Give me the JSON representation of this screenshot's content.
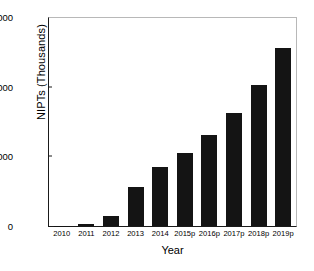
{
  "chart_data": {
    "type": "bar",
    "title": "",
    "xlabel": "Year",
    "ylabel": "NIPTs (Thousands)",
    "categories": [
      "2010",
      "2011",
      "2012",
      "2013",
      "2014",
      "2015p",
      "2016p",
      "2017p",
      "2018p",
      "2019p"
    ],
    "values": [
      5,
      25,
      150,
      560,
      840,
      1050,
      1300,
      1620,
      2030,
      2550
    ],
    "ylim": [
      0,
      3000
    ],
    "y_ticks": [
      0,
      1000,
      2000,
      3000
    ],
    "y_tick_labels": [
      "0",
      "1,000",
      "2,000",
      "3,000"
    ],
    "grid": false,
    "legend": "none",
    "bar_color": "#141414",
    "axis_color": "#1a1a1a",
    "frame_color": "#b8b8b8",
    "background": "#ffffff"
  }
}
